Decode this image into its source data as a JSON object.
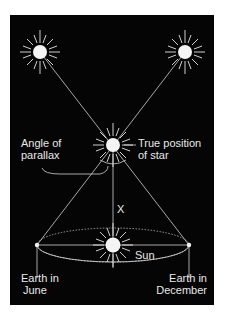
{
  "diagram": {
    "background_color": "#050505",
    "line_color": "#d8d8d8",
    "labels": {
      "angle_of_parallax_line1": "Angle of",
      "angle_of_parallax_line2": "parallax",
      "true_position_line1": "True position",
      "true_position_line2": "of star",
      "distance": "X",
      "sun": "Sun",
      "earth_june_line1": "Earth in",
      "earth_june_line2": "June",
      "earth_december_line1": "Earth in",
      "earth_december_line2": "December"
    },
    "nodes": [
      {
        "id": "apparent-star-left",
        "x": 40,
        "y": 52
      },
      {
        "id": "apparent-star-right",
        "x": 185,
        "y": 52
      },
      {
        "id": "true-star",
        "x": 113,
        "y": 145
      },
      {
        "id": "sun",
        "x": 113,
        "y": 245
      },
      {
        "id": "earth-june",
        "x": 37,
        "y": 245
      },
      {
        "id": "earth-december",
        "x": 189,
        "y": 245
      }
    ]
  }
}
